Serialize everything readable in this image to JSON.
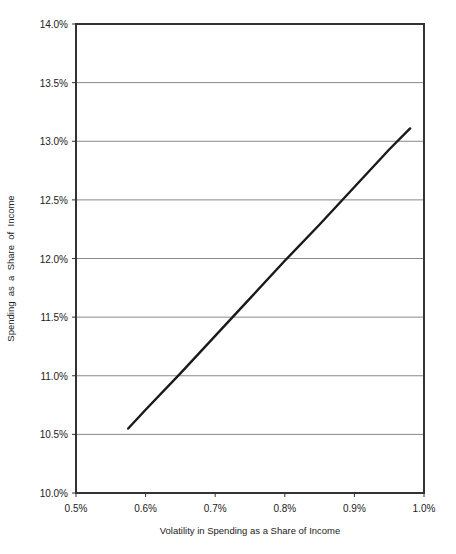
{
  "chart_data": {
    "type": "line",
    "title": "",
    "xlabel": "Volatility in Spending as a Share of Income",
    "ylabel": "Spending  as  a  Share  of  Income",
    "xlim": [
      0.5,
      1.0
    ],
    "ylim": [
      10.0,
      14.0
    ],
    "x_ticks": [
      "0.5%",
      "0.6%",
      "0.7%",
      "0.8%",
      "0.9%",
      "1.0%"
    ],
    "x_tick_values": [
      0.5,
      0.6,
      0.7,
      0.8,
      0.9,
      1.0
    ],
    "y_ticks": [
      "10.0%",
      "10.5%",
      "11.0%",
      "11.5%",
      "12.0%",
      "12.5%",
      "13.0%",
      "13.5%",
      "14.0%"
    ],
    "y_tick_values": [
      10.0,
      10.5,
      11.0,
      11.5,
      12.0,
      12.5,
      13.0,
      13.5,
      14.0
    ],
    "grid": "horizontal",
    "legend": "none",
    "series": [
      {
        "name": "Spending vs Volatility",
        "x": [
          0.575,
          0.6,
          0.65,
          0.7,
          0.75,
          0.8,
          0.85,
          0.9,
          0.95,
          0.98
        ],
        "y": [
          10.55,
          10.71,
          11.02,
          11.34,
          11.66,
          11.98,
          12.29,
          12.61,
          12.93,
          13.11
        ]
      }
    ],
    "colors": {
      "line": "#1a1a1a",
      "grid": "#888888",
      "frame": "#333333"
    }
  }
}
